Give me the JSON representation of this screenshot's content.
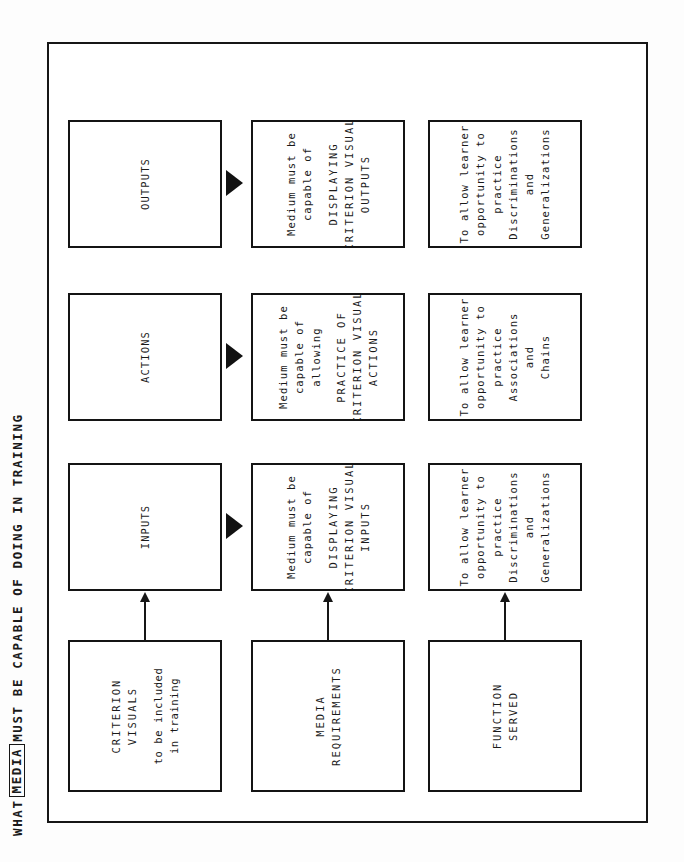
{
  "figure": {
    "title_prefix": "WHAT",
    "title_boxed_word": "MEDIA",
    "title_suffix": "MUST BE CAPABLE OF DOING IN TRAINING",
    "orientation": "rotated-90-ccw",
    "frame_color": "#161616",
    "background_color": "#ffffff"
  },
  "columns": [
    {
      "id": "outputs",
      "header": {
        "lines": [
          "OUTPUTS"
        ],
        "style": "caps"
      },
      "requirement": {
        "lines": [
          "Medium must be",
          "capable of",
          "DISPLAYING",
          "CRITERION VISUAL",
          "OUTPUTS"
        ],
        "emphasis_from_line": 2
      },
      "function": {
        "lines": [
          "To allow learner",
          "opportunity to",
          "practice",
          "Discriminations",
          "and",
          "Generalizations"
        ]
      }
    },
    {
      "id": "actions",
      "header": {
        "lines": [
          "ACTIONS"
        ],
        "style": "caps"
      },
      "requirement": {
        "lines": [
          "Medium must be",
          "capable of",
          "allowing",
          "PRACTICE OF",
          "CRITERION VISUAL",
          "ACTIONS"
        ],
        "emphasis_from_line": 3
      },
      "function": {
        "lines": [
          "To allow learner",
          "opportunity to",
          "practice",
          "Associations",
          "and",
          "Chains"
        ]
      }
    },
    {
      "id": "inputs",
      "header": {
        "lines": [
          "INPUTS"
        ],
        "style": "caps"
      },
      "requirement": {
        "lines": [
          "Medium must be",
          "capable of",
          "DISPLAYING",
          "CRITERION VISUAL",
          "INPUTS"
        ],
        "emphasis_from_line": 2
      },
      "function": {
        "lines": [
          "To allow learner",
          "opportunity to",
          "practice",
          "Discriminations",
          "and",
          "Generalizations"
        ]
      }
    }
  ],
  "source_row": {
    "criterion_visuals": {
      "title_lines": [
        "CRITERION",
        "VISUALS"
      ],
      "sub_lines": [
        "to be included",
        "in training"
      ]
    },
    "media_requirements": {
      "title_lines": [
        "MEDIA",
        "REQUIREMENTS"
      ],
      "sub_lines": []
    },
    "function_served": {
      "title_lines": [
        "FUNCTION",
        "SERVED"
      ],
      "sub_lines": []
    }
  },
  "connectors": {
    "triangle_label": "flow-triangle",
    "arrow_label": "derivation-arrow",
    "triangle_count": 3,
    "arrow_count": 3
  }
}
